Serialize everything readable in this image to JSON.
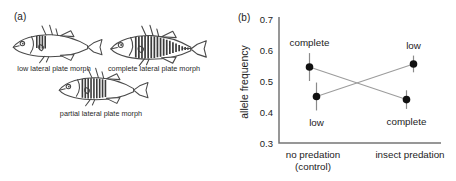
{
  "figure": {
    "panel_a": {
      "tag": "(a)",
      "morphs": [
        {
          "name": "low",
          "label": "low lateral plate morph"
        },
        {
          "name": "complete",
          "label": "complete lateral plate morph"
        },
        {
          "name": "partial",
          "label": "partial lateral plate morph"
        }
      ]
    },
    "panel_b": {
      "tag": "(b)"
    }
  },
  "chart_data": {
    "type": "line",
    "title": "",
    "categories": [
      "no predation",
      "insect predation"
    ],
    "category_sublabels": [
      "(control)",
      ""
    ],
    "xlabel": "",
    "ylabel": "allele frequency",
    "ylim": [
      0.3,
      0.7
    ],
    "yticks": [
      0.3,
      0.4,
      0.5,
      0.6,
      0.7
    ],
    "grid": false,
    "legend_position": "point-labels",
    "marker": "filled-circle",
    "error_bars": true,
    "series": [
      {
        "name": "complete",
        "values": [
          0.545,
          0.44
        ],
        "errors": [
          0.045,
          0.03
        ],
        "label_positions": [
          "above",
          "below"
        ]
      },
      {
        "name": "low",
        "values": [
          0.45,
          0.555
        ],
        "errors": [
          0.045,
          0.027
        ],
        "label_positions": [
          "below",
          "above"
        ]
      }
    ]
  },
  "colors": {
    "background": "#ffffff",
    "text": "#1c1c1c",
    "axis": "#767676",
    "series_line": "#9c9c9c",
    "marker": "#111111",
    "error_bar": "#8a8a8a",
    "fish_outline": "#4a4a4a",
    "fish_plates": "#3c3c3c"
  }
}
